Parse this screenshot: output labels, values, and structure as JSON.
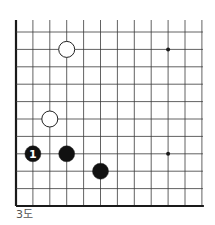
{
  "diagram": {
    "caption": "3도",
    "colors": {
      "line": "#3a3a3a",
      "edge": "#1a1a1a",
      "black_stone": "#111111",
      "white_stone": "#ffffff",
      "stone_outline": "#222222",
      "label_on_black": "#ffffff",
      "caption": "#555555"
    },
    "grid": {
      "columns": 12,
      "rows": 11,
      "origin_x": 16,
      "origin_y": 32,
      "spacing_x": 16.9,
      "spacing_y": 17.4,
      "top_extend": 20,
      "left_edge_thick": true,
      "bottom_edge_thick": true
    },
    "star_points": [
      {
        "col": 9,
        "row": 1
      },
      {
        "col": 9,
        "row": 7
      }
    ],
    "stones": [
      {
        "color": "white",
        "col": 3,
        "row": 1,
        "label": ""
      },
      {
        "color": "white",
        "col": 2,
        "row": 5,
        "label": ""
      },
      {
        "color": "black",
        "col": 1,
        "row": 7,
        "label": "1"
      },
      {
        "color": "black",
        "col": 3,
        "row": 7,
        "label": ""
      },
      {
        "color": "black",
        "col": 5,
        "row": 8,
        "label": ""
      }
    ]
  }
}
